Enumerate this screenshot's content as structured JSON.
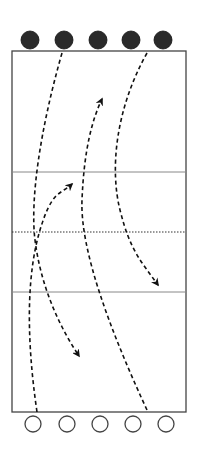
{
  "title_clipped": "drill diagram top caption (cut off)",
  "court": {
    "x": 12,
    "y": 51,
    "width": 174,
    "height": 361,
    "border_color": "#444444",
    "attack_line_top_y": 172,
    "net_y": 232,
    "attack_line_bottom_y": 292,
    "line_color": "#888888"
  },
  "team_top": {
    "label": "filled players",
    "color": "#2a2a2a",
    "y": 40,
    "r": 9,
    "x": [
      30,
      64,
      98,
      131,
      163
    ]
  },
  "team_bottom": {
    "label": "outlined players",
    "color": "#444444",
    "y": 424,
    "r": 8,
    "x": [
      33,
      67,
      100,
      133,
      166
    ]
  },
  "paths": [
    {
      "name": "path-top-left-down",
      "d": "M62 53 C 40 130, 30 200, 35 240 S 55 320, 79 356",
      "arrow": true
    },
    {
      "name": "path-top-right-down",
      "d": "M147 53 C 115 110, 110 170, 120 210 S 140 260, 158 285",
      "arrow": true
    },
    {
      "name": "path-bottom-left-up",
      "d": "M37 412 C 25 330, 28 270, 40 230 S 60 195, 72 184",
      "arrow": true
    },
    {
      "name": "path-bottom-right-up",
      "d": "M147 410 C 110 330, 80 250, 82 200 S 92 120, 102 99",
      "arrow": true
    }
  ]
}
